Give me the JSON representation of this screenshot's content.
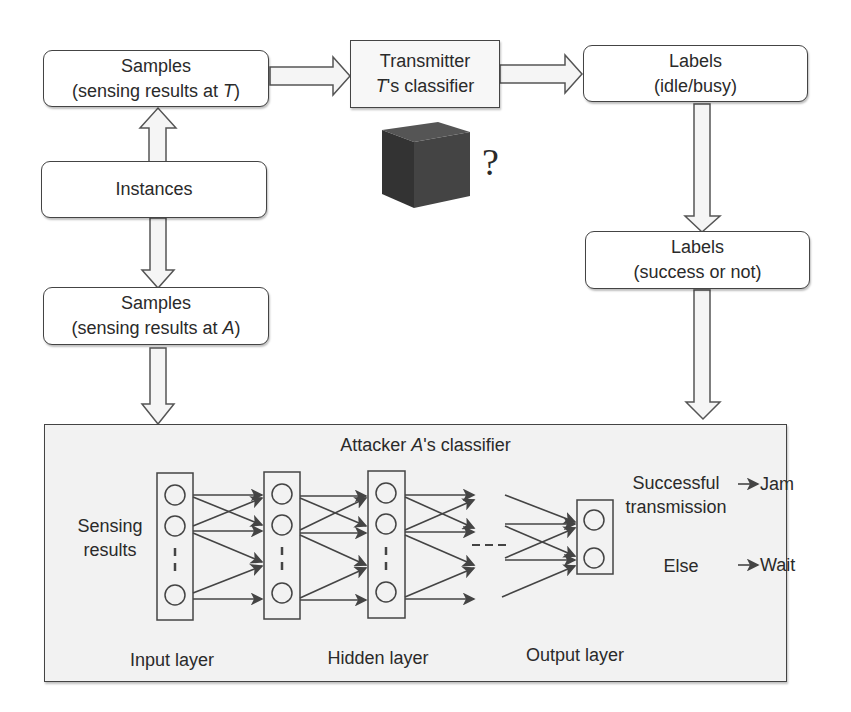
{
  "top_row": {
    "samples_T": {
      "line1": "Samples",
      "line2_prefix": "(sensing results at ",
      "line2_var": "T",
      "line2_suffix": ")"
    },
    "transmitter": {
      "line1": "Transmitter",
      "line2_var": "T",
      "line2_suffix": "'s classifier"
    },
    "labels_idle": {
      "line1": "Labels",
      "line2": "(idle/busy)"
    }
  },
  "black_box": {
    "question_mark": "?"
  },
  "instances": {
    "label": "Instances"
  },
  "samples_A": {
    "line1": "Samples",
    "line2_prefix": "(sensing results at ",
    "line2_var": "A",
    "line2_suffix": ")"
  },
  "labels_success": {
    "line1": "Labels",
    "line2": "(success or not)"
  },
  "attacker_classifier": {
    "title_prefix": "Attacker ",
    "title_var": "A",
    "title_suffix": "'s classifier",
    "input_text_line1": "Sensing",
    "input_text_line2": "results",
    "layers": [
      "Input layer",
      "Hidden layer",
      "Output layer"
    ],
    "outputs": [
      {
        "condition_line1": "Successful",
        "condition_line2": "transmission",
        "action": "Jam"
      },
      {
        "condition_line1": "Else",
        "condition_line2": "",
        "action": "Wait"
      }
    ]
  },
  "colors": {
    "stroke": "#444444",
    "panel_bg": "#f2f2f2",
    "cube": "#3a3a3a"
  }
}
